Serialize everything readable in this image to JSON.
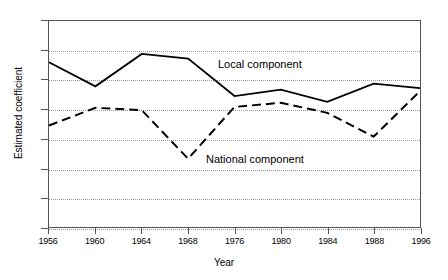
{
  "chart_data": {
    "type": "line",
    "title": "",
    "xlabel": "Year",
    "ylabel": "Estimated coefficient",
    "categories": [
      "1956",
      "1960",
      "1964",
      "1968",
      "1976",
      "1980",
      "1984",
      "1988",
      "1996"
    ],
    "x": [
      1956,
      1960,
      1964,
      1968,
      1976,
      1980,
      1984,
      1988,
      1996
    ],
    "xlim": [
      0,
      8
    ],
    "ylim": [
      0,
      0.7
    ],
    "yticks": [
      "0",
      "0.1",
      "0.2",
      "0.3",
      "0.4",
      "0.5",
      "0.6",
      "0.7"
    ],
    "ytick_values": [
      0,
      0.1,
      0.2,
      0.3,
      0.4,
      0.5,
      0.6,
      0.7
    ],
    "grid": true,
    "grid_style": "dotted-horizontal",
    "legend": "inline-annotations",
    "series": [
      {
        "name": "Local component",
        "style": "solid",
        "color": "#000000",
        "values": [
          0.56,
          0.478,
          0.588,
          0.572,
          0.445,
          0.467,
          0.425,
          0.487,
          0.472
        ]
      },
      {
        "name": "National component",
        "style": "dashed",
        "color": "#000000",
        "values": [
          0.345,
          0.405,
          0.397,
          0.232,
          0.408,
          0.422,
          0.388,
          0.307,
          0.462
        ]
      }
    ],
    "annotations": [
      {
        "text": "Local component",
        "series": "Local component"
      },
      {
        "text": "National component",
        "series": "National component"
      }
    ]
  },
  "axis": {
    "y_label": "Estimated coefficient",
    "x_label": "Year"
  }
}
